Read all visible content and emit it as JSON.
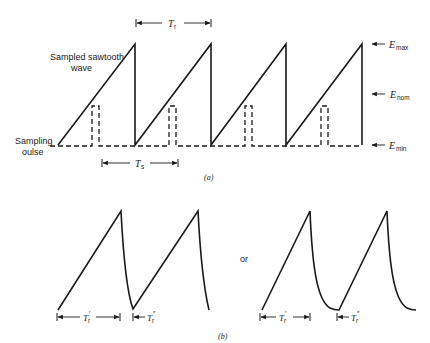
{
  "figure_a": {
    "caption": "(a)",
    "wave_label_line1": "Sampled sawtooth",
    "wave_label_line2": "wave",
    "pulse_label_line1": "Sampling",
    "pulse_label_line2": "oulse",
    "period_label": "T",
    "period_sub": "r",
    "sample_label": "T",
    "sample_sub": "s",
    "levels": {
      "max": {
        "symbol": "E",
        "sub": "max"
      },
      "nom": {
        "symbol": "E",
        "sub": "nom"
      },
      "min": {
        "symbol": "E",
        "sub": "min"
      }
    }
  },
  "figure_b": {
    "caption": "(b)",
    "connector": "or",
    "left": {
      "rise_label": "T",
      "rise_sub": "r",
      "rise_prime": "′",
      "fall_label": "T",
      "fall_sub": "r",
      "fall_prime": "″"
    },
    "right": {
      "rise_label": "T",
      "rise_sub": "r",
      "rise_prime": "′",
      "fall_label": "T",
      "fall_sub": "r",
      "fall_prime": "″"
    }
  },
  "colors": {
    "ink": "#1a1a1a",
    "background": "#ffffff"
  }
}
